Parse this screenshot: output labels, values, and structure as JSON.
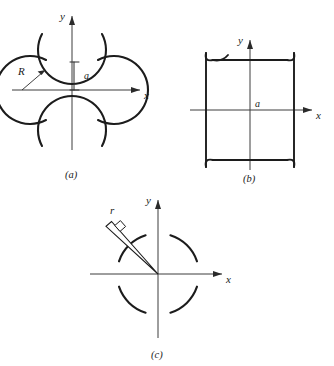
{
  "figure": {
    "panels": [
      {
        "id": "a",
        "caption": "(a)",
        "axis_x_label": "x",
        "axis_y_label": "y",
        "labels": {
          "radius": "R",
          "gap": "a"
        },
        "description": "four circular arcs centered on the axes with concave sides facing the origin"
      },
      {
        "id": "b",
        "caption": "(b)",
        "axis_x_label": "x",
        "axis_y_label": "y",
        "labels": {
          "halfwidth": "a"
        },
        "description": "square outline with outward flaring concave corner fillets"
      },
      {
        "id": "c",
        "caption": "(c)",
        "axis_x_label": "x",
        "axis_y_label": "y",
        "labels": {
          "radius": "r"
        },
        "description": "segmented circle of four arcs with a tapered radius arrow at 135 degrees"
      }
    ],
    "colors": {
      "curve": "#1c1c1c",
      "axis": "#3d3d3d",
      "background": "#ffffff",
      "text": "#1a1a1a"
    }
  }
}
